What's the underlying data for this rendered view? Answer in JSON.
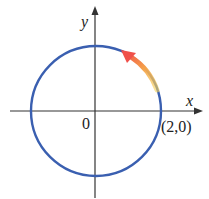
{
  "diagram": {
    "type": "unit-circle-motion",
    "axes": {
      "x_label": "x",
      "y_label": "y",
      "origin_label": "0"
    },
    "point_label": "(2,0)",
    "colors": {
      "circle": "#3a5fb0",
      "axis": "#333333",
      "arrow_start": "#f5c24a",
      "arrow_end": "#f0504a"
    }
  }
}
